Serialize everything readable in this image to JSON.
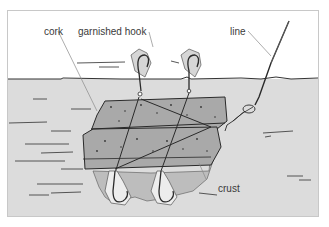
{
  "diagram": {
    "labels": {
      "cork": "cork",
      "garnished_hook": "garnished hook",
      "line": "line",
      "crust": "crust"
    },
    "colors": {
      "sky": "#ffffff",
      "water": "#dcdcdc",
      "cork": "#a9a9a9",
      "outline": "#2a2a2a",
      "leader": "#8a8a8a",
      "crust": "#bdbdbd"
    }
  }
}
